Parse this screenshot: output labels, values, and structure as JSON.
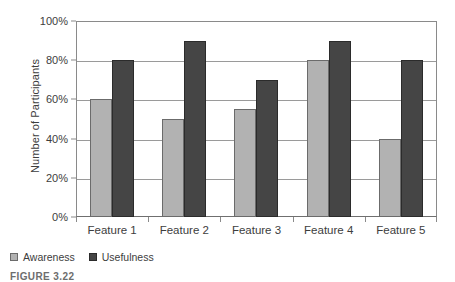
{
  "chart_data": {
    "type": "bar",
    "title": "",
    "xlabel": "",
    "ylabel": "Number of Participants",
    "categories": [
      "Feature 1",
      "Feature 2",
      "Feature 3",
      "Feature 4",
      "Feature 5"
    ],
    "series": [
      {
        "name": "Awareness",
        "color": "#b2b2b2",
        "values": [
          60,
          50,
          55,
          80,
          40
        ]
      },
      {
        "name": "Usefulness",
        "color": "#454545",
        "values": [
          80,
          90,
          70,
          90,
          80
        ]
      }
    ],
    "ylim": [
      0,
      100
    ],
    "ytick_values": [
      0,
      20,
      40,
      60,
      80,
      100
    ],
    "ytick_labels": [
      "0%",
      "20%",
      "40%",
      "60%",
      "80%",
      "100%"
    ],
    "grid": true,
    "legend_position": "bottom-left",
    "value_suffix": "%"
  },
  "caption": {
    "text": "FIGURE 3.22"
  }
}
